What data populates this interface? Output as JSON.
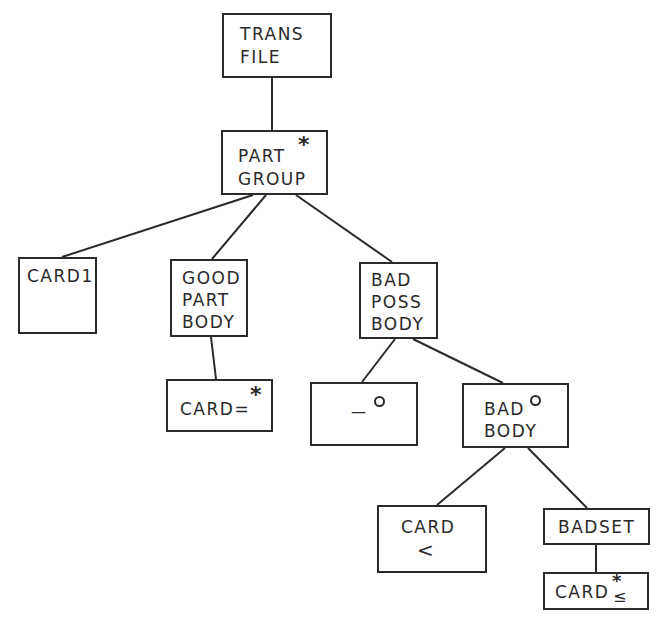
{
  "diagram": {
    "type": "jackson-structure-diagram",
    "line_color": "#2a2a2a",
    "nodes": [
      {
        "id": "trans_file",
        "line1": "TRANS",
        "line2": "FILE"
      },
      {
        "id": "part_group",
        "line1": "PART",
        "line2": "GROUP",
        "marker": "*"
      },
      {
        "id": "card1",
        "line1": "CARD1"
      },
      {
        "id": "good_part_body",
        "line1": "GOOD",
        "line2": "PART",
        "line3": "BODY"
      },
      {
        "id": "card_eq",
        "line1": "CARD=",
        "marker": "*"
      },
      {
        "id": "null_option",
        "line1": "—",
        "marker": "°"
      },
      {
        "id": "bad_poss_body",
        "line1": "BAD",
        "line2": "POSS",
        "line3": "BODY"
      },
      {
        "id": "bad_body",
        "line1": "BAD",
        "line2": "BODY",
        "marker": "°"
      },
      {
        "id": "card_lt",
        "line1": "CARD",
        "line2": "<"
      },
      {
        "id": "badset",
        "line1": "BADSET"
      },
      {
        "id": "card_le",
        "line1": "CARD",
        "marker": "*",
        "sub": "≤"
      }
    ],
    "edges": [
      [
        "trans_file",
        "part_group"
      ],
      [
        "part_group",
        "card1"
      ],
      [
        "part_group",
        "good_part_body"
      ],
      [
        "part_group",
        "bad_poss_body"
      ],
      [
        "good_part_body",
        "card_eq"
      ],
      [
        "bad_poss_body",
        "null_option"
      ],
      [
        "bad_poss_body",
        "bad_body"
      ],
      [
        "bad_body",
        "card_lt"
      ],
      [
        "bad_body",
        "badset"
      ],
      [
        "badset",
        "card_le"
      ]
    ]
  }
}
